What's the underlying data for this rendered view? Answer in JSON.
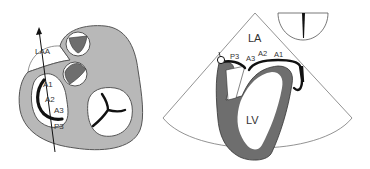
{
  "colors": {
    "tissue": "#b8b8b8",
    "myocardium": "#6e6e6e",
    "leaflet": "#111111",
    "outline": "#555555",
    "background": "#ffffff"
  },
  "left_panel": {
    "title": "Short-axis view of heart base",
    "labels": {
      "laa": "LAA",
      "a1": "A1",
      "a2": "A2",
      "a3": "A3",
      "p3": "P3"
    }
  },
  "right_panel": {
    "title": "Echocardiographic sector view",
    "labels": {
      "la": "LA",
      "lv": "LV",
      "p3": "P3",
      "a3": "A3",
      "a2": "A2",
      "a1": "A1"
    }
  }
}
